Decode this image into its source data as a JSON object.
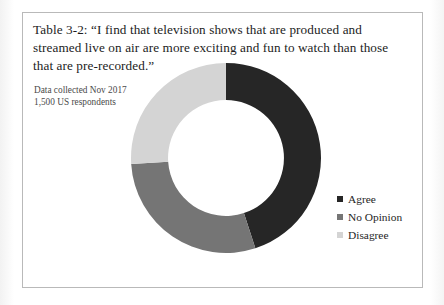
{
  "figure": {
    "caption": "Table 3-2: “I find that television shows that are produced and streamed live on air are more exciting and fun to watch than those that are pre-recorded.”",
    "data_note_line1": "Data collected Nov 2017",
    "data_note_line2": "1,500 US respondents"
  },
  "chart_data": {
    "type": "pie",
    "variant": "donut",
    "title": "Table 3-2: “I find that television shows that are produced and streamed live on air are more exciting and fun to watch than those that are pre-recorded.”",
    "subtitle": "Data collected Nov 2017 / 1,500 US respondents",
    "categories": [
      "Agree",
      "No Opinion",
      "Disagree"
    ],
    "values": [
      45,
      29,
      26
    ],
    "value_unit": "percent",
    "colors": [
      "#262626",
      "#757575",
      "#d4d4d4"
    ],
    "start_angle_deg": 0,
    "direction": "clockwise",
    "inner_radius_ratio": 0.61,
    "legend_position": "right",
    "grid": false,
    "data_labels_shown": false,
    "xlabel": "",
    "ylabel": ""
  },
  "legend": {
    "items": [
      {
        "label": "Agree",
        "color": "#262626"
      },
      {
        "label": "No Opinion",
        "color": "#757575"
      },
      {
        "label": "Disagree",
        "color": "#d4d4d4"
      }
    ]
  }
}
